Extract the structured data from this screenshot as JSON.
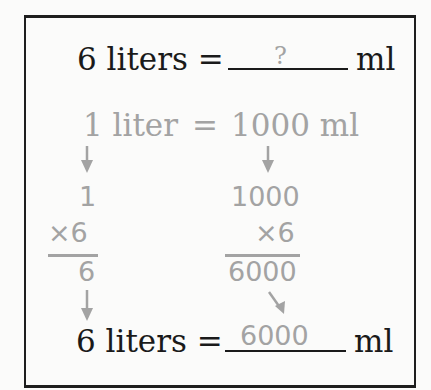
{
  "problem": {
    "left": "6 liters =",
    "blank_value": "?",
    "unit": "ml"
  },
  "fact": {
    "left": "1 liter",
    "equals": "=",
    "right": "1000 ml"
  },
  "left_column": {
    "top": "1",
    "multiplier": "×6",
    "result": "6"
  },
  "right_column": {
    "top": "1000",
    "multiplier": "×6",
    "result": "6000"
  },
  "answer": {
    "left": "6 liters =",
    "blank_value": "6000",
    "unit": "ml"
  },
  "colors": {
    "ink": "#1a1a1a",
    "work": "#a3a3a3",
    "background": "#fbfbfa"
  }
}
